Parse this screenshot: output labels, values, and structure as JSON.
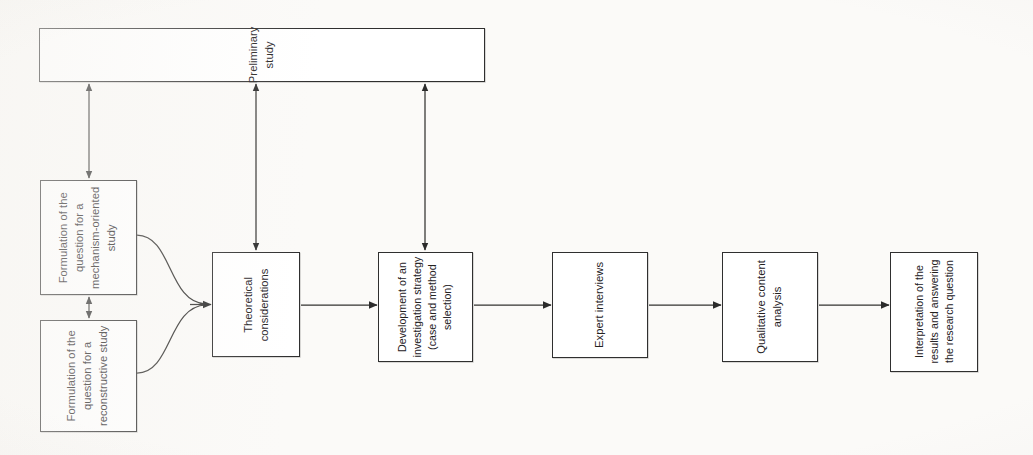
{
  "diagram": {
    "orientation": "text-rotated-90-ccw",
    "background_color": "#fbfaf8",
    "ink_color": "#2f2f2f",
    "nodes": [
      {
        "id": "preliminary-study",
        "label": "Preliminary\nstudy",
        "x": 39,
        "y": 28,
        "w": 446,
        "h": 54
      },
      {
        "id": "formulation-mechanism",
        "label": "Formulation of the\nquestion for a\nmechanism-oriented\nstudy",
        "x": 40,
        "y": 180,
        "w": 97,
        "h": 115
      },
      {
        "id": "formulation-reconstructive",
        "label": "Formulation of the\nquestion for a\nreconstructive study",
        "x": 40,
        "y": 320,
        "w": 97,
        "h": 112
      },
      {
        "id": "theoretical-considerations",
        "label": "Theoretical\nconsiderations",
        "x": 212,
        "y": 252,
        "w": 88,
        "h": 105
      },
      {
        "id": "investigation-strategy",
        "label": "Development of an\ninvestigation strategy\n(case and method\nselection)",
        "x": 378,
        "y": 252,
        "w": 95,
        "h": 110
      },
      {
        "id": "expert-interviews",
        "label": "Expert interviews",
        "x": 552,
        "y": 252,
        "w": 96,
        "h": 106
      },
      {
        "id": "qualitative-content-analysis",
        "label": "Qualitative content\nanalysis",
        "x": 722,
        "y": 252,
        "w": 96,
        "h": 110
      },
      {
        "id": "interpretation-results",
        "label": "Interpretation of the\nresults and answering\nthe research question",
        "x": 890,
        "y": 252,
        "w": 88,
        "h": 120
      }
    ],
    "connectors": [
      {
        "id": "mechanism-to-theoretical",
        "type": "curve",
        "from": "formulation-mechanism",
        "to": "theoretical-considerations",
        "arrowheads": "end"
      },
      {
        "id": "reconstructive-to-theoretical",
        "type": "curve",
        "from": "formulation-reconstructive",
        "to": "theoretical-considerations",
        "arrowheads": "end"
      },
      {
        "id": "mechanism-to-reconstructive",
        "type": "straight",
        "from": "formulation-mechanism",
        "to": "formulation-reconstructive",
        "arrowheads": "both"
      },
      {
        "id": "theoretical-to-strategy",
        "type": "straight",
        "from": "theoretical-considerations",
        "to": "investigation-strategy",
        "arrowheads": "end"
      },
      {
        "id": "strategy-to-interviews",
        "type": "straight",
        "from": "investigation-strategy",
        "to": "expert-interviews",
        "arrowheads": "end"
      },
      {
        "id": "interviews-to-analysis",
        "type": "straight",
        "from": "expert-interviews",
        "to": "qualitative-content-analysis",
        "arrowheads": "end"
      },
      {
        "id": "analysis-to-interpretation",
        "type": "straight",
        "from": "qualitative-content-analysis",
        "to": "interpretation-results",
        "arrowheads": "end"
      },
      {
        "id": "preliminary-to-mechanism",
        "type": "straight",
        "from": "preliminary-study",
        "to": "formulation-mechanism",
        "arrowheads": "both"
      },
      {
        "id": "preliminary-to-theoretical",
        "type": "straight",
        "from": "preliminary-study",
        "to": "theoretical-considerations",
        "arrowheads": "both"
      },
      {
        "id": "preliminary-to-strategy",
        "type": "straight",
        "from": "preliminary-study",
        "to": "investigation-strategy",
        "arrowheads": "both"
      }
    ]
  }
}
